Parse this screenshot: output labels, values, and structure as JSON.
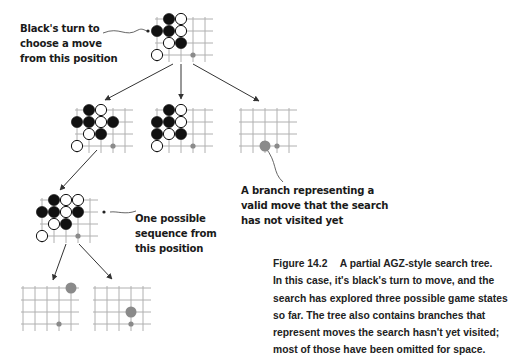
{
  "annotations": {
    "root": [
      "Black's turn to",
      "choose a move",
      "from this position"
    ],
    "unvisited": [
      "A branch representing a",
      "valid move that the search",
      "has not visited yet"
    ],
    "sequence": [
      "One possible",
      "sequence from",
      "this position"
    ]
  },
  "caption": {
    "figure_number": "Figure 14.2",
    "title": "A partial AGZ-style search tree.",
    "lines": [
      "In this case, it's black's turn to move, and the",
      "search has explored three possible game states",
      "so far. The tree also contains branches that",
      "represent moves the search hasn't yet visited;",
      "most of those have been omitted for space."
    ]
  },
  "colors": {
    "grid": "#b0b0b0",
    "black_stone": "#111111",
    "white_stone": "#ffffff",
    "candidate_move": "#8a8a8a",
    "arrow": "#333333"
  },
  "boards": [
    {
      "id": "root",
      "x": 151,
      "y": 13,
      "stones": [
        {
          "c": 1,
          "r": 0,
          "color": "black"
        },
        {
          "c": 2,
          "r": 0,
          "color": "white"
        },
        {
          "c": 0,
          "r": 1,
          "color": "black"
        },
        {
          "c": 1,
          "r": 1,
          "color": "black"
        },
        {
          "c": 2,
          "r": 1,
          "color": "white"
        },
        {
          "c": 1,
          "r": 2,
          "color": "white"
        },
        {
          "c": 2,
          "r": 2,
          "color": "black"
        },
        {
          "c": 0,
          "r": 3,
          "color": "white"
        }
      ],
      "dots": [
        {
          "c": 3,
          "r": 3,
          "size": "small"
        }
      ]
    },
    {
      "id": "child-left",
      "x": 71,
      "y": 104,
      "stones": [
        {
          "c": 1,
          "r": 0,
          "color": "black"
        },
        {
          "c": 2,
          "r": 0,
          "color": "white"
        },
        {
          "c": 0,
          "r": 1,
          "color": "black"
        },
        {
          "c": 1,
          "r": 1,
          "color": "black"
        },
        {
          "c": 2,
          "r": 1,
          "color": "white"
        },
        {
          "c": 3,
          "r": 1,
          "color": "black"
        },
        {
          "c": 1,
          "r": 2,
          "color": "white"
        },
        {
          "c": 2,
          "r": 2,
          "color": "black"
        },
        {
          "c": 0,
          "r": 3,
          "color": "white"
        }
      ],
      "dots": [
        {
          "c": 3,
          "r": 3,
          "size": "small"
        }
      ]
    },
    {
      "id": "child-middle",
      "x": 151,
      "y": 104,
      "stones": [
        {
          "c": 1,
          "r": 0,
          "color": "black"
        },
        {
          "c": 2,
          "r": 0,
          "color": "white"
        },
        {
          "c": 0,
          "r": 1,
          "color": "black"
        },
        {
          "c": 1,
          "r": 1,
          "color": "black"
        },
        {
          "c": 2,
          "r": 1,
          "color": "white"
        },
        {
          "c": 0,
          "r": 2,
          "color": "black"
        },
        {
          "c": 1,
          "r": 2,
          "color": "white"
        },
        {
          "c": 2,
          "r": 2,
          "color": "black"
        },
        {
          "c": 0,
          "r": 3,
          "color": "white"
        }
      ],
      "dots": [
        {
          "c": 3,
          "r": 3,
          "size": "small"
        }
      ]
    },
    {
      "id": "child-unvisited",
      "x": 235,
      "y": 104,
      "stones": [],
      "dots": [
        {
          "c": 2,
          "r": 3,
          "size": "large"
        },
        {
          "c": 3,
          "r": 3,
          "size": "small"
        }
      ]
    },
    {
      "id": "grandchild",
      "x": 36,
      "y": 194,
      "stones": [
        {
          "c": 1,
          "r": 0,
          "color": "black"
        },
        {
          "c": 2,
          "r": 0,
          "color": "white"
        },
        {
          "c": 3,
          "r": 0,
          "color": "white"
        },
        {
          "c": 0,
          "r": 1,
          "color": "black"
        },
        {
          "c": 1,
          "r": 1,
          "color": "black"
        },
        {
          "c": 2,
          "r": 1,
          "color": "white"
        },
        {
          "c": 3,
          "r": 1,
          "color": "black"
        },
        {
          "c": 1,
          "r": 2,
          "color": "white"
        },
        {
          "c": 2,
          "r": 2,
          "color": "black"
        },
        {
          "c": 0,
          "r": 3,
          "color": "white"
        }
      ],
      "dots": [
        {
          "c": 3,
          "r": 3,
          "size": "small"
        }
      ]
    },
    {
      "id": "leaf-left",
      "x": 17,
      "y": 282,
      "stones": [],
      "dots": [
        {
          "c": 4,
          "r": 0,
          "size": "large"
        },
        {
          "c": 3,
          "r": 3,
          "size": "small"
        }
      ]
    },
    {
      "id": "leaf-right",
      "x": 89,
      "y": 282,
      "stones": [],
      "dots": [
        {
          "c": 3,
          "r": 2,
          "size": "large"
        },
        {
          "c": 3,
          "r": 3,
          "size": "small"
        }
      ]
    }
  ],
  "edges": [
    {
      "from": [
        173,
        64
      ],
      "to": [
        105,
        100
      ]
    },
    {
      "from": [
        181,
        64
      ],
      "to": [
        181,
        99
      ]
    },
    {
      "from": [
        193,
        64
      ],
      "to": [
        259,
        101
      ]
    },
    {
      "from": [
        97,
        150
      ],
      "to": [
        60,
        190
      ]
    },
    {
      "from": [
        66,
        244
      ],
      "to": [
        53,
        280
      ]
    },
    {
      "from": [
        79,
        244
      ],
      "to": [
        112,
        279
      ]
    }
  ],
  "callouts": [
    {
      "path": "M 103 33 C 120 26, 125 38, 138 30 C 142 28, 144 30, 147 31",
      "arrow_at": [
        148,
        31
      ]
    },
    {
      "path": "M 136 211 C 125 215, 118 211, 110 212",
      "arrow_at": [
        104,
        212
      ]
    },
    {
      "path": "M 283 182 C 272 172, 278 163, 265 147",
      "arrow_at": [
        263,
        143
      ]
    }
  ]
}
